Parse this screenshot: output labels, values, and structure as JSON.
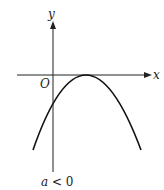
{
  "diagram": {
    "axes": {
      "x_label": "x",
      "y_label": "y",
      "origin_label": "O"
    },
    "curve": {
      "type": "downward-opening parabola",
      "vertex": "touches x-axis to the right of origin"
    },
    "caption": {
      "a": "a",
      "rest": " < 0"
    }
  }
}
